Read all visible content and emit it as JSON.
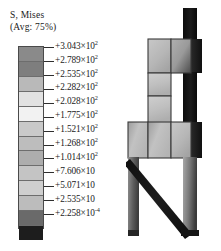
{
  "legend": {
    "title": "S, Mises",
    "subtitle": "(Avg: 75%)",
    "entries": [
      {
        "text": "+3.043×10",
        "exp": "2",
        "color": "#8a8a8a"
      },
      {
        "text": "+2.789×10",
        "exp": "2",
        "color": "#7e7e7e"
      },
      {
        "text": "+2.535×10",
        "exp": "2",
        "color": "#b9b9b9"
      },
      {
        "text": "+2.282×10",
        "exp": "2",
        "color": "#e2e2e2"
      },
      {
        "text": "+2.028×10",
        "exp": "2",
        "color": "#f2f2f2"
      },
      {
        "text": "+1.775×10",
        "exp": "2",
        "color": "#c9c9c9"
      },
      {
        "text": "+1.521×10",
        "exp": "2",
        "color": "#bdbdbd"
      },
      {
        "text": "+1.268×10",
        "exp": "2",
        "color": "#adadad"
      },
      {
        "text": "+1.014×10",
        "exp": "2",
        "color": "#c4c4c4"
      },
      {
        "text": "+7.606×10",
        "exp": "",
        "color": "#cfcfcf"
      },
      {
        "text": "+5.071×10",
        "exp": "",
        "color": "#bcbcbc"
      },
      {
        "text": "+2.535×10",
        "exp": "",
        "color": "#6a6a6a"
      },
      {
        "text": "+2.258×10",
        "exp": "-4",
        "color": "#1d1d1d"
      }
    ]
  },
  "chart_data": {
    "type": "heatmap",
    "title": "S, Mises",
    "subtitle": "(Avg: 75%)",
    "variable": "S, Mises",
    "averaging": "75%",
    "colormap": "grayscale",
    "legend_position": "left",
    "grid": false,
    "contour_levels": [
      304.3,
      278.9,
      253.5,
      228.2,
      202.8,
      177.5,
      152.1,
      126.8,
      101.4,
      76.06,
      50.71,
      25.35,
      0.0002258
    ],
    "level_labels": [
      "+3.043×10²",
      "+2.789×10²",
      "+2.535×10²",
      "+2.282×10²",
      "+2.028×10²",
      "+1.775×10²",
      "+1.521×10²",
      "+1.268×10²",
      "+1.014×10²",
      "+7.606×10",
      "+5.071×10",
      "+2.535×10",
      "+2.258×10⁻⁴"
    ],
    "level_colors": [
      "#8a8a8a",
      "#7e7e7e",
      "#b9b9b9",
      "#e2e2e2",
      "#f2f2f2",
      "#c9c9c9",
      "#bdbdbd",
      "#adadad",
      "#c4c4c4",
      "#cfcfcf",
      "#bcbcbc",
      "#6a6a6a",
      "#1d1d1d"
    ],
    "value_min": 0.0002258,
    "value_max": 304.3,
    "units": "stress",
    "xlabel": "",
    "ylabel": "",
    "annotations": []
  },
  "model": {
    "name": "stress-contour-model",
    "description": "Braced frame finite element stress contour plot",
    "parts": [
      {
        "name": "vertical-column",
        "shade": "#121212"
      },
      {
        "name": "upper-panel-row",
        "shade": "#b4b4b4"
      },
      {
        "name": "mid-panel-row",
        "shade": "#bebebe"
      },
      {
        "name": "lower-beam-row",
        "shade": "#b2b2b2"
      },
      {
        "name": "diagonal-brace",
        "shade": "#151515"
      },
      {
        "name": "left-leg",
        "shade": "#6f6f6f"
      },
      {
        "name": "right-leg",
        "shade": "#5a5a5a"
      }
    ]
  }
}
